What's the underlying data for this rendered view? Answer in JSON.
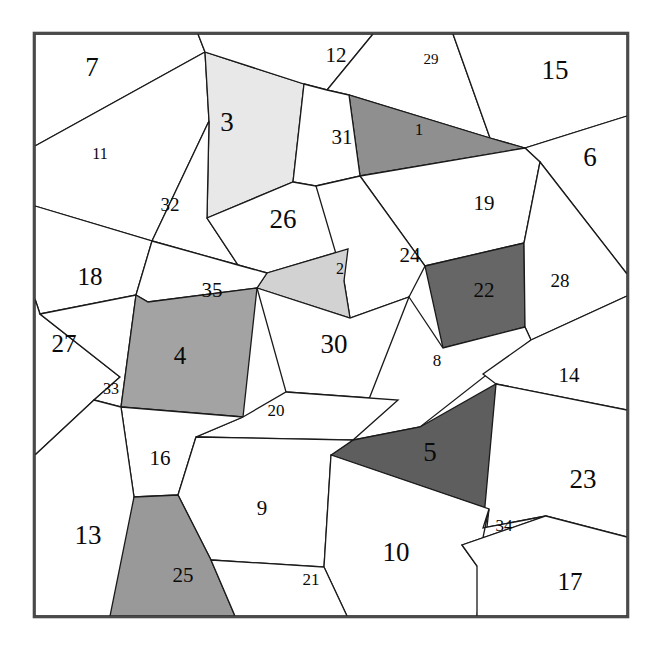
{
  "figure": {
    "title": "",
    "type": "polygonal-tiling-diagram",
    "width": 657,
    "height": 653,
    "background_color": "#ffffff",
    "frame": {
      "x": 34,
      "y": 33,
      "width": 594,
      "height": 584,
      "stroke_color": "#4a4a4a"
    },
    "palette": {
      "white": "#ffffff",
      "light_gray": "#e8e8e8",
      "light_medium_gray": "#d2d2d2",
      "medium_gray": "#a3a3a3",
      "medium_dark_gray": "#999999",
      "dark_gray": "#737373",
      "stroke": "#1a1a1a",
      "text": "#0a0a0a"
    }
  },
  "chart_data": {
    "type": "table",
    "title": "",
    "xlabel": "",
    "ylabel": "",
    "legend": [],
    "note": "Partition of a square into 35 labeled convex polygon cells; fill shade encodes cell group.",
    "categories": [
      "1",
      "2",
      "3",
      "4",
      "5",
      "6",
      "7",
      "8",
      "9",
      "10",
      "11",
      "12",
      "13",
      "14",
      "15",
      "16",
      "17",
      "18",
      "19",
      "20",
      "21",
      "22",
      "23",
      "24",
      "25",
      "26",
      "27",
      "28",
      "29",
      "30",
      "31",
      "32",
      "33",
      "34",
      "35"
    ],
    "values": [
      1,
      2,
      3,
      4,
      5,
      6,
      7,
      8,
      9,
      10,
      11,
      12,
      13,
      14,
      15,
      16,
      17,
      18,
      19,
      20,
      21,
      22,
      23,
      24,
      25,
      26,
      27,
      28,
      29,
      30,
      31,
      32,
      33,
      34,
      35
    ]
  },
  "cells": [
    {
      "id": "cell-7",
      "label": "7",
      "fill": "#ffffff",
      "font_size": 27,
      "label_x": 92,
      "label_y": 70,
      "points": "35,34 35,146 205,52 198,34"
    },
    {
      "id": "cell-11",
      "label": "11",
      "fill": "#ffffff",
      "font_size": 16,
      "label_x": 100,
      "label_y": 155,
      "points": "35,146 205,52 209,121 152,241 35,206"
    },
    {
      "id": "cell-3",
      "label": "3",
      "fill": "#e8e8e8",
      "font_size": 27,
      "label_x": 227,
      "label_y": 125,
      "points": "205,52 304,84 293,182 207,218 209,121"
    },
    {
      "id": "cell-32",
      "label": "32",
      "fill": "#ffffff",
      "font_size": 19,
      "label_x": 170,
      "label_y": 207,
      "points": "209,121 207,218 238,265 152,241"
    },
    {
      "id": "cell-12",
      "label": "12",
      "fill": "#ffffff",
      "font_size": 21,
      "label_x": 336,
      "label_y": 57,
      "points": "198,34 205,52 304,84 327,90 373,34"
    },
    {
      "id": "cell-29",
      "label": "29",
      "fill": "#ffffff",
      "font_size": 15,
      "label_x": 431,
      "label_y": 61,
      "points": "373,34 327,90 349,95 490,138 453,34"
    },
    {
      "id": "cell-15",
      "label": "15",
      "fill": "#ffffff",
      "font_size": 27,
      "label_x": 555,
      "label_y": 73,
      "points": "453,34 490,138 525,148 627,116 627,34"
    },
    {
      "id": "cell-1",
      "label": "1",
      "fill": "#8f8f8f",
      "font_size": 17,
      "label_x": 419,
      "label_y": 131,
      "points": "349,95 490,138 525,148 360,176"
    },
    {
      "id": "cell-31",
      "label": "31",
      "fill": "#ffffff",
      "font_size": 21,
      "label_x": 342,
      "label_y": 139,
      "points": "304,84 327,90 349,95 360,176 316,186 293,182"
    },
    {
      "id": "cell-6",
      "label": "6",
      "fill": "#ffffff",
      "font_size": 27,
      "label_x": 590,
      "label_y": 160,
      "points": "627,116 525,148 540,162 627,274"
    },
    {
      "id": "cell-19",
      "label": "19",
      "fill": "#ffffff",
      "font_size": 21,
      "label_x": 484,
      "label_y": 205,
      "points": "360,176 525,148 540,162 524,243 425,266"
    },
    {
      "id": "cell-26",
      "label": "26",
      "fill": "#ffffff",
      "font_size": 27,
      "label_x": 283,
      "label_y": 222,
      "points": "293,182 316,186 348,249 267,273 238,265 207,218"
    },
    {
      "id": "cell-24",
      "label": "24",
      "fill": "#ffffff",
      "font_size": 21,
      "label_x": 410,
      "label_y": 257,
      "points": "316,186 360,176 425,266 409,297 350,318 344,281"
    },
    {
      "id": "cell-2",
      "label": "2",
      "fill": "#d2d2d2",
      "font_size": 16,
      "label_x": 340,
      "label_y": 270,
      "points": "348,249 344,281 350,318 257,288 267,273"
    },
    {
      "id": "cell-22",
      "label": "22",
      "fill": "#666666",
      "font_size": 21,
      "label_x": 484,
      "label_y": 292,
      "points": "425,266 524,243 525,327 443,348"
    },
    {
      "id": "cell-28",
      "label": "28",
      "fill": "#ffffff",
      "font_size": 19,
      "label_x": 560,
      "label_y": 283,
      "points": "540,162 627,274 627,296 531,340 525,327 524,243"
    },
    {
      "id": "cell-18",
      "label": "18",
      "fill": "#ffffff",
      "font_size": 25,
      "label_x": 90,
      "label_y": 279,
      "points": "35,206 152,241 136,295 40,314 35,299"
    },
    {
      "id": "cell-35",
      "label": "35",
      "fill": "#ffffff",
      "font_size": 21,
      "label_x": 212,
      "label_y": 292,
      "points": "152,241 238,265 267,273 257,288 148,302 136,295"
    },
    {
      "id": "cell-27",
      "label": "27",
      "fill": "#ffffff",
      "font_size": 25,
      "label_x": 64,
      "label_y": 346,
      "points": "35,299 40,314 120,377 94,400 35,455"
    },
    {
      "id": "cell-33",
      "label": "33",
      "fill": "#ffffff",
      "font_size": 16,
      "label_x": 111,
      "label_y": 390,
      "points": "40,314 136,295 121,407 94,400 120,377"
    },
    {
      "id": "cell-4",
      "label": "4",
      "fill": "#a3a3a3",
      "font_size": 25,
      "label_x": 180,
      "label_y": 358,
      "points": "136,295 148,302 257,288 243,417 121,407"
    },
    {
      "id": "cell-30",
      "label": "30",
      "fill": "#ffffff",
      "font_size": 27,
      "label_x": 334,
      "label_y": 347,
      "points": "257,288 350,318 409,297 398,400 286,392"
    },
    {
      "id": "cell-8",
      "label": "8",
      "fill": "#ffffff",
      "font_size": 17,
      "label_x": 437,
      "label_y": 362,
      "points": "409,297 443,348 525,327 531,340 420,427 353,440"
    },
    {
      "id": "cell-14",
      "label": "14",
      "fill": "#ffffff",
      "font_size": 21,
      "label_x": 569,
      "label_y": 377,
      "points": "531,340 627,296 627,410 496,384 483,374"
    },
    {
      "id": "cell-20",
      "label": "20",
      "fill": "#ffffff",
      "font_size": 17,
      "label_x": 276,
      "label_y": 412,
      "points": "286,392 398,400 353,440 196,437 243,417"
    },
    {
      "id": "cell-5",
      "label": "5",
      "fill": "#5e5e5e",
      "font_size": 27,
      "label_x": 430,
      "label_y": 455,
      "points": "420,427 496,384 489,509 331,455 353,440"
    },
    {
      "id": "cell-16",
      "label": "16",
      "fill": "#ffffff",
      "font_size": 21,
      "label_x": 160,
      "label_y": 460,
      "points": "121,407 243,417 196,437 178,495 134,497"
    },
    {
      "id": "cell-23",
      "label": "23",
      "fill": "#ffffff",
      "font_size": 27,
      "label_x": 583,
      "label_y": 482,
      "points": "496,384 627,410 627,537 546,516 483,528"
    },
    {
      "id": "cell-13",
      "label": "13",
      "fill": "#ffffff",
      "font_size": 27,
      "label_x": 88,
      "label_y": 538,
      "points": "35,455 94,400 121,407 134,497 148,616 35,616"
    },
    {
      "id": "cell-9",
      "label": "9",
      "fill": "#ffffff",
      "font_size": 21,
      "label_x": 262,
      "label_y": 510,
      "points": "196,437 353,440 331,455 324,567 211,560 178,495"
    },
    {
      "id": "cell-25",
      "label": "25",
      "fill": "#999999",
      "font_size": 21,
      "label_x": 183,
      "label_y": 577,
      "points": "178,495 211,560 235,616 110,616 134,497"
    },
    {
      "id": "cell-10",
      "label": "10",
      "fill": "#ffffff",
      "font_size": 27,
      "label_x": 396,
      "label_y": 555,
      "points": "331,455 489,509 477,616 347,616 324,567"
    },
    {
      "id": "cell-21",
      "label": "21",
      "fill": "#ffffff",
      "font_size": 17,
      "label_x": 311,
      "label_y": 581,
      "points": "211,560 324,567 347,616 235,616"
    },
    {
      "id": "cell-34",
      "label": "34",
      "fill": "#ffffff",
      "font_size": 17,
      "label_x": 504,
      "label_y": 527,
      "points": "489,509 483,528 546,516 462,545 477,566"
    },
    {
      "id": "cell-17",
      "label": "17",
      "fill": "#ffffff",
      "font_size": 25,
      "label_x": 570,
      "label_y": 584,
      "points": "462,545 546,516 627,537 627,616 477,616 477,566"
    }
  ]
}
